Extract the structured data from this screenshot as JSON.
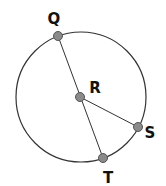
{
  "diagram": {
    "type": "circle-geometry",
    "circle": {
      "cx": 81,
      "cy": 97,
      "r": 65,
      "stroke": "#333333"
    },
    "points": [
      {
        "id": "Q",
        "label": "Q",
        "x": 58,
        "y": 36,
        "label_x": 54,
        "label_y": 24
      },
      {
        "id": "R",
        "label": "R",
        "x": 80,
        "y": 97,
        "label_x": 95,
        "label_y": 92
      },
      {
        "id": "S",
        "label": "S",
        "x": 138,
        "y": 127,
        "label_x": 150,
        "label_y": 137
      },
      {
        "id": "T",
        "label": "T",
        "x": 103,
        "y": 158,
        "label_x": 108,
        "label_y": 182
      }
    ],
    "segments": [
      {
        "from": "Q",
        "to": "T",
        "description": "diameter QT through center R"
      },
      {
        "from": "R",
        "to": "S",
        "description": "radius RS"
      }
    ],
    "point_fill": "#8a8a8a",
    "point_stroke": "#555555",
    "line_color": "#333333"
  }
}
